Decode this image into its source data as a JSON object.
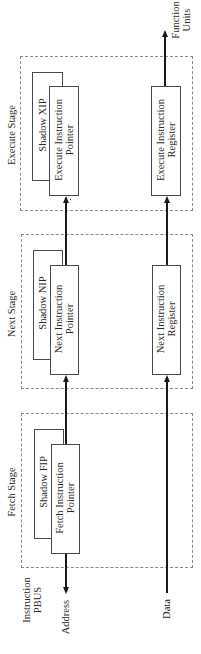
{
  "stages": {
    "fetch": {
      "label": "Fetch Stage",
      "shadow_box": "Shadow FIP",
      "pointer_box": [
        "Fetch Instruction",
        "Pointer"
      ]
    },
    "next": {
      "label": "Next Stage",
      "shadow_box": "Shadow NIP",
      "pointer_box": [
        "Next Instruction",
        "Pointer"
      ],
      "register_box": [
        "Next Instruction",
        "Register"
      ]
    },
    "execute": {
      "label": "Execute Stage",
      "shadow_box": "Shadow XIP",
      "pointer_box": [
        "Execute Instruction",
        "Pointer"
      ],
      "register_box": [
        "Execute Instruction",
        "Register"
      ]
    }
  },
  "bus": {
    "label": [
      "Instruction",
      "PBUS"
    ],
    "address": "Address",
    "data": "Data"
  },
  "output": {
    "label": [
      "Function",
      "Units"
    ]
  },
  "colors": {
    "line": "#1a1a1a",
    "box_border": "#4a4a4a",
    "dashed_border": "#8a8a8a",
    "text": "#2a2a2a"
  }
}
